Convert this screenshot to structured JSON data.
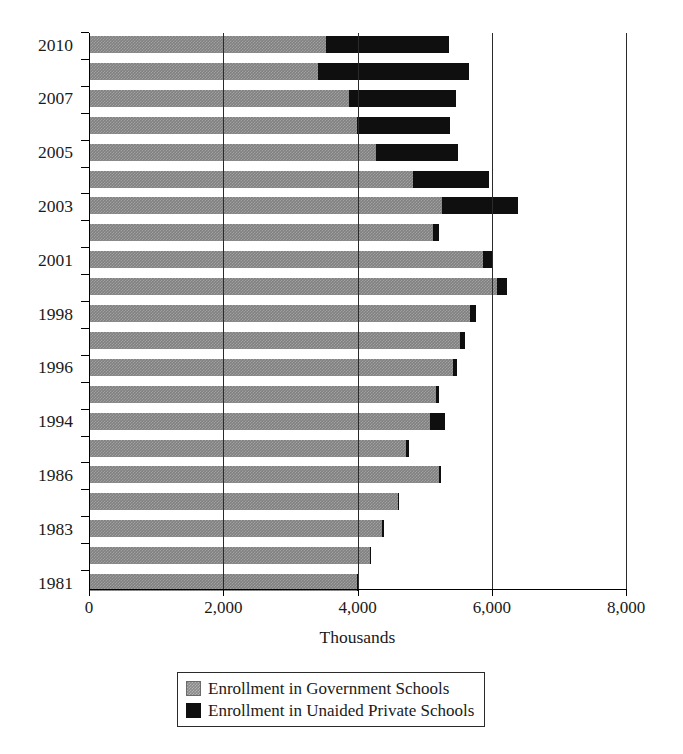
{
  "chart_data": {
    "type": "bar",
    "orientation": "horizontal",
    "stacked": true,
    "title": "",
    "xlabel": "Thousands",
    "ylabel": "",
    "xlim": [
      0,
      8000
    ],
    "xticks": [
      0,
      2000,
      4000,
      6000,
      8000
    ],
    "xtick_labels": [
      "0",
      "2,000",
      "4,000",
      "6,000",
      "8,000"
    ],
    "grid": true,
    "gridlines_at": [
      2000,
      4000,
      6000,
      8000
    ],
    "legend_position": "bottom",
    "categories": [
      "2010",
      "2009",
      "2007",
      "2006",
      "2005",
      "2004",
      "2003",
      "2002",
      "2001",
      "2000",
      "1998",
      "1997",
      "1996",
      "1995",
      "1994",
      "1993",
      "1986",
      "1985",
      "1983",
      "1982",
      "1981"
    ],
    "visible_tick_labels": [
      "2010",
      "",
      "2007",
      "",
      "2005",
      "",
      "2003",
      "",
      "2001",
      "",
      "1998",
      "",
      "1996",
      "",
      "1994",
      "",
      "1986",
      "",
      "1983",
      "",
      "1981"
    ],
    "series": [
      {
        "name": "Enrollment in Government Schools",
        "color": "#808080",
        "values": [
          3530,
          3410,
          3880,
          3990,
          4270,
          4830,
          5260,
          5120,
          5870,
          6080,
          5680,
          5530,
          5430,
          5170,
          5080,
          4720,
          5220,
          4600,
          4370,
          4180,
          3990
        ]
      },
      {
        "name": "Enrollment in Unaided Private Schools",
        "color": "#100f0f",
        "values": [
          1830,
          2250,
          1590,
          1390,
          1230,
          1130,
          1130,
          90,
          130,
          140,
          80,
          70,
          50,
          40,
          230,
          50,
          30,
          20,
          20,
          20,
          20
        ]
      }
    ],
    "totals": [
      5360,
      5660,
      5470,
      5380,
      5500,
      5960,
      6390,
      5210,
      6000,
      6220,
      5760,
      5600,
      5480,
      5210,
      5310,
      4770,
      5250,
      4620,
      4390,
      4200,
      4010
    ]
  },
  "legend": {
    "items": [
      {
        "label": "Enrollment in Government Schools",
        "swatch": "gray-hatched-swatch"
      },
      {
        "label": "Enrollment in Unaided Private Schools",
        "swatch": "black-swatch"
      }
    ]
  }
}
